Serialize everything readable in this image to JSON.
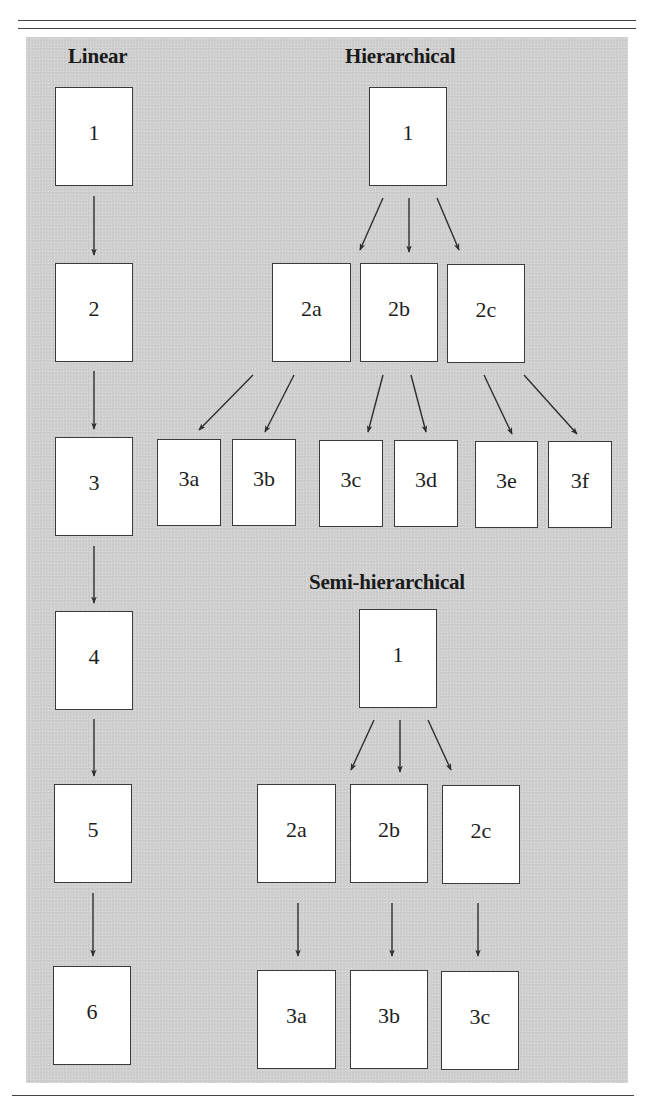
{
  "figure": {
    "sections": [
      {
        "id": "linear",
        "title": "Linear",
        "title_pos": [
          68,
          44
        ]
      },
      {
        "id": "hierarchical",
        "title": "Hierarchical",
        "title_pos": [
          345,
          44
        ]
      },
      {
        "id": "semi",
        "title": "Semi-hierarchical",
        "title_pos": [
          309,
          570
        ]
      }
    ],
    "linear": {
      "boxes": [
        {
          "label": "1",
          "x": 55,
          "y": 87,
          "w": 78,
          "h": 99
        },
        {
          "label": "2",
          "x": 55,
          "y": 263,
          "w": 78,
          "h": 99
        },
        {
          "label": "3",
          "x": 55,
          "y": 437,
          "w": 78,
          "h": 99
        },
        {
          "label": "4",
          "x": 55,
          "y": 611,
          "w": 78,
          "h": 99
        },
        {
          "label": "5",
          "x": 54,
          "y": 784,
          "w": 78,
          "h": 99
        },
        {
          "label": "6",
          "x": 53,
          "y": 966,
          "w": 78,
          "h": 99
        }
      ]
    },
    "hierarchical": {
      "level1": [
        {
          "label": "1",
          "x": 369,
          "y": 87,
          "w": 78,
          "h": 99
        }
      ],
      "level2": [
        {
          "label": "2a",
          "x": 272,
          "y": 263,
          "w": 79,
          "h": 99
        },
        {
          "label": "2b",
          "x": 360,
          "y": 263,
          "w": 78,
          "h": 99
        },
        {
          "label": "2c",
          "x": 447,
          "y": 264,
          "w": 78,
          "h": 99
        }
      ],
      "level3": [
        {
          "label": "3a",
          "x": 157,
          "y": 439,
          "w": 64,
          "h": 87
        },
        {
          "label": "3b",
          "x": 232,
          "y": 439,
          "w": 64,
          "h": 87
        },
        {
          "label": "3c",
          "x": 319,
          "y": 440,
          "w": 64,
          "h": 87
        },
        {
          "label": "3d",
          "x": 394,
          "y": 440,
          "w": 64,
          "h": 87
        },
        {
          "label": "3e",
          "x": 475,
          "y": 441,
          "w": 63,
          "h": 87
        },
        {
          "label": "3f",
          "x": 548,
          "y": 441,
          "w": 64,
          "h": 87
        }
      ]
    },
    "semi_hierarchical": {
      "level1": [
        {
          "label": "1",
          "x": 359,
          "y": 609,
          "w": 78,
          "h": 99
        }
      ],
      "level2": [
        {
          "label": "2a",
          "x": 257,
          "y": 784,
          "w": 79,
          "h": 99
        },
        {
          "label": "2b",
          "x": 350,
          "y": 784,
          "w": 78,
          "h": 99
        },
        {
          "label": "2c",
          "x": 442,
          "y": 785,
          "w": 78,
          "h": 99
        }
      ],
      "level3": [
        {
          "label": "3a",
          "x": 257,
          "y": 970,
          "w": 79,
          "h": 99
        },
        {
          "label": "3b",
          "x": 350,
          "y": 970,
          "w": 78,
          "h": 99
        },
        {
          "label": "3c",
          "x": 441,
          "y": 971,
          "w": 78,
          "h": 99
        }
      ]
    },
    "arrows": [
      [
        94,
        196,
        94,
        255
      ],
      [
        94,
        371,
        94,
        429
      ],
      [
        94,
        546,
        94,
        603
      ],
      [
        94,
        719,
        94,
        776
      ],
      [
        93,
        893,
        93,
        956
      ],
      [
        383,
        198,
        360,
        250
      ],
      [
        409,
        198,
        409,
        252
      ],
      [
        437,
        198,
        459,
        250
      ],
      [
        253,
        375,
        199,
        430
      ],
      [
        294,
        375,
        265,
        432
      ],
      [
        383,
        375,
        368,
        432
      ],
      [
        411,
        375,
        426,
        432
      ],
      [
        484,
        375,
        512,
        434
      ],
      [
        524,
        375,
        577,
        434
      ],
      [
        374,
        720,
        351,
        770
      ],
      [
        400,
        720,
        400,
        772
      ],
      [
        428,
        720,
        451,
        770
      ],
      [
        298,
        903,
        298,
        956
      ],
      [
        392,
        903,
        392,
        956
      ],
      [
        478,
        903,
        478,
        956
      ]
    ],
    "colors": {
      "panel": "#cfcfcf",
      "box": "#ffffff",
      "stroke": "#2e2e2e"
    }
  }
}
